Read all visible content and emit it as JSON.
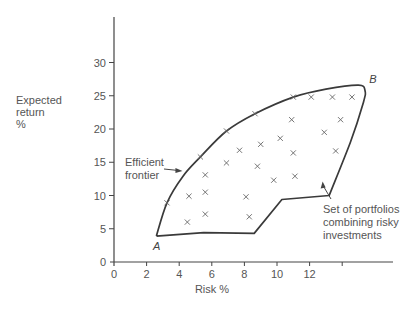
{
  "chart_data": {
    "type": "scatter",
    "title": "",
    "xlabel": "Risk %",
    "ylabel": [
      "Expected",
      "return",
      "%"
    ],
    "xlim": [
      0,
      16.5
    ],
    "ylim": [
      0,
      35
    ],
    "x_ticks": [
      0,
      2,
      4,
      6,
      8,
      10,
      12,
      14
    ],
    "x_tick_labels": [
      "0",
      "2",
      "4",
      "6",
      "8",
      "10",
      "12",
      ""
    ],
    "y_ticks": [
      0,
      5,
      10,
      15,
      20,
      25,
      30
    ],
    "y_tick_labels": [
      "0",
      "5",
      "10",
      "15",
      "20",
      "25",
      "30"
    ],
    "grid": false,
    "series": [
      {
        "name": "Portfolios",
        "marker": "x",
        "points": [
          [
            3.25,
            8.9
          ],
          [
            5.3,
            15.8
          ],
          [
            6.9,
            19.7
          ],
          [
            8.65,
            22.3
          ],
          [
            11.0,
            24.8
          ],
          [
            12.1,
            24.8
          ],
          [
            13.4,
            24.8
          ],
          [
            14.6,
            24.8
          ],
          [
            10.9,
            21.4
          ],
          [
            13.9,
            21.4
          ],
          [
            12.9,
            19.5
          ],
          [
            10.2,
            18.6
          ],
          [
            9.0,
            17.7
          ],
          [
            7.7,
            16.8
          ],
          [
            11.0,
            16.4
          ],
          [
            13.6,
            16.7
          ],
          [
            6.9,
            14.9
          ],
          [
            8.8,
            14.4
          ],
          [
            11.1,
            12.9
          ],
          [
            9.8,
            12.3
          ],
          [
            5.6,
            13.1
          ],
          [
            4.6,
            9.9
          ],
          [
            5.6,
            10.5
          ],
          [
            8.1,
            9.8
          ],
          [
            4.5,
            6.0
          ],
          [
            5.6,
            7.2
          ],
          [
            8.3,
            6.8
          ]
        ]
      }
    ],
    "region_outline": [
      [
        2.6,
        3.9
      ],
      [
        3.25,
        8.9
      ],
      [
        4.2,
        12.8
      ],
      [
        5.3,
        15.8
      ],
      [
        6.9,
        19.7
      ],
      [
        8.65,
        22.3
      ],
      [
        11.0,
        24.8
      ],
      [
        13.0,
        26.0
      ],
      [
        15.0,
        26.6
      ],
      [
        15.4,
        25.8
      ],
      [
        15.3,
        24.0
      ],
      [
        14.5,
        18.0
      ],
      [
        13.2,
        10.0
      ],
      [
        10.3,
        9.4
      ],
      [
        8.6,
        4.3
      ],
      [
        5.5,
        4.4
      ],
      [
        2.6,
        3.9
      ]
    ],
    "annotations": [
      {
        "text": "A",
        "x": 2.4,
        "y": 2.4,
        "italic": true
      },
      {
        "text": "B",
        "x": 15.9,
        "y": 27.5,
        "italic": true
      },
      {
        "text_lines": [
          "Efficient",
          "frontier"
        ],
        "arrow_to": [
          4.2,
          13.7
        ],
        "placement": "left-of-frontier"
      },
      {
        "text_lines": [
          "Set of portfolios",
          "combining risky",
          "investments"
        ],
        "arrow_to": [
          12.8,
          12.1
        ],
        "placement": "lower-right"
      }
    ],
    "legend": null
  }
}
